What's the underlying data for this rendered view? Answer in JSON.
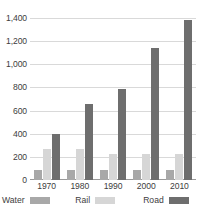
{
  "chart_data": {
    "type": "bar",
    "title": "",
    "subtitle": "",
    "xlabel": "",
    "ylabel": "",
    "categories": [
      "1970",
      "1980",
      "1990",
      "2000",
      "2010"
    ],
    "series": [
      {
        "name": "Water",
        "color": "#a8a8a8",
        "values": [
          90,
          90,
          90,
          90,
          90
        ]
      },
      {
        "name": "Rail",
        "color": "#d6d6d6",
        "values": [
          270,
          270,
          230,
          230,
          230
        ]
      },
      {
        "name": "Road",
        "color": "#6e6e6e",
        "values": [
          400,
          665,
          790,
          1150,
          1390
        ]
      }
    ],
    "ylim": [
      0,
      1400
    ],
    "yticks": [
      0,
      200,
      400,
      600,
      800,
      1000,
      1200,
      1400
    ],
    "ytick_labels": [
      "0",
      "200",
      "400",
      "600",
      "800",
      "1,000",
      "1,200",
      "1,400"
    ],
    "grid": true,
    "legend_position": "bottom",
    "legend": [
      "Water",
      "Rail",
      "Road"
    ]
  },
  "axis": {
    "y_tick_labels": [
      "1,400",
      "1,200",
      "1,000",
      "800",
      "600",
      "400",
      "200",
      "0"
    ],
    "x_tick_labels": [
      "1970",
      "1980",
      "1990",
      "2000",
      "2010"
    ]
  },
  "legend": {
    "items": [
      {
        "label": "Water",
        "swatch": "water-swatch"
      },
      {
        "label": "Rail",
        "swatch": "rail-swatch"
      },
      {
        "label": "Road",
        "swatch": "road-swatch"
      }
    ]
  },
  "caption_sliver": ""
}
